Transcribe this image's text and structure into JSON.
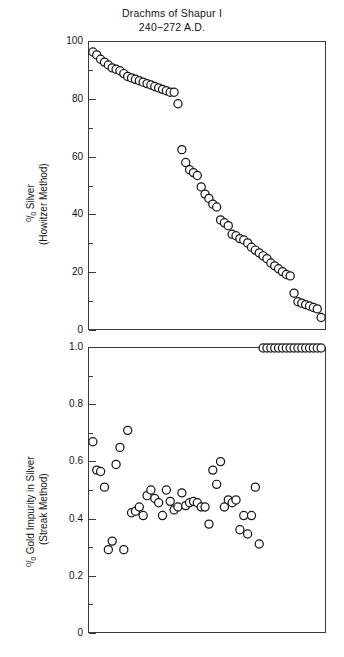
{
  "figure": {
    "title_line1": "Drachms of Shapur I",
    "title_line2": "240−272 A.D."
  },
  "panels": {
    "top": {
      "axis_title_line1": "Silver",
      "axis_title_line2": "(Howitzer Method)",
      "percent_symbol": "%",
      "ytick_labels": [
        "100",
        "80",
        "60",
        "40",
        "20",
        "0"
      ]
    },
    "bottom": {
      "axis_title_line1": "Gold Impurity in Silver",
      "axis_title_line2": "(Streak Method)",
      "percent_symbol": "%",
      "ytick_labels": [
        "1.0",
        "0.8",
        "0.6",
        "0.4",
        "0.2",
        "0"
      ]
    }
  },
  "chart_data": [
    {
      "type": "scatter",
      "title": "Drachms of Shapur I 240−272 A.D.",
      "panel": "top",
      "xlabel": "",
      "ylabel": "% Silver (Howitzer Method)",
      "ylim": [
        0,
        100
      ],
      "xlim": [
        0,
        61
      ],
      "yticks": [
        0,
        20,
        40,
        60,
        80,
        100
      ],
      "yminorticks": [
        10,
        30,
        50,
        70,
        90
      ],
      "xticks": [],
      "grid": false,
      "legend": false,
      "marker": "open-circle",
      "series": [
        {
          "name": "% Silver (Howitzer Method)",
          "x": [
            1,
            2,
            3,
            4,
            5,
            6,
            7,
            8,
            9,
            10,
            11,
            12,
            13,
            14,
            15,
            16,
            17,
            18,
            19,
            20,
            21,
            22,
            23,
            24,
            25,
            26,
            27,
            28,
            29,
            30,
            31,
            32,
            33,
            34,
            35,
            36,
            37,
            38,
            39,
            40,
            41,
            42,
            43,
            44,
            45,
            46,
            47,
            48,
            49,
            50,
            51,
            52,
            53,
            54,
            55,
            56,
            57,
            58,
            59,
            60
          ],
          "y": [
            96.5,
            95.5,
            94.0,
            93.0,
            92.0,
            91.0,
            90.5,
            90.0,
            89.0,
            88.0,
            87.5,
            87.0,
            86.5,
            86.0,
            85.5,
            85.0,
            84.5,
            84.0,
            83.5,
            83.0,
            82.5,
            82.5,
            78.5,
            62.5,
            58.0,
            55.5,
            54.5,
            53.5,
            49.5,
            47.0,
            45.5,
            43.5,
            42.5,
            38.0,
            37.0,
            36.0,
            33.0,
            32.5,
            31.5,
            31.0,
            30.0,
            28.5,
            27.5,
            26.5,
            25.5,
            24.5,
            23.0,
            22.0,
            21.0,
            20.0,
            19.0,
            18.5,
            12.5,
            9.5,
            9.0,
            8.5,
            8.0,
            7.5,
            7.0,
            4.0
          ]
        }
      ]
    },
    {
      "type": "scatter",
      "panel": "bottom",
      "xlabel": "",
      "ylabel": "% Gold Impurity in Silver (Streak Method)",
      "ylim": [
        0,
        1.0
      ],
      "xlim": [
        0,
        61
      ],
      "yticks": [
        0,
        0.2,
        0.4,
        0.6,
        0.8,
        1.0
      ],
      "yminorticks": [
        0.1,
        0.3,
        0.5,
        0.7,
        0.9
      ],
      "xticks": [],
      "grid": false,
      "legend": false,
      "marker": "open-circle",
      "series": [
        {
          "name": "% Gold Impurity in Silver (Streak Method)",
          "x": [
            1,
            2,
            3,
            4,
            5,
            6,
            7,
            8,
            9,
            10,
            11,
            12,
            13,
            14,
            15,
            16,
            17,
            18,
            19,
            20,
            21,
            22,
            23,
            24,
            25,
            26,
            27,
            28,
            29,
            30,
            31,
            32,
            33,
            34,
            35,
            36,
            37,
            38,
            39,
            40,
            41,
            42,
            43,
            44,
            45,
            46,
            47,
            48,
            49,
            50,
            51,
            52,
            53,
            54,
            55,
            56,
            57,
            58,
            59,
            60
          ],
          "y": [
            0.67,
            0.57,
            0.565,
            0.51,
            0.29,
            0.32,
            0.59,
            0.65,
            0.29,
            0.71,
            0.42,
            0.425,
            0.44,
            0.41,
            0.48,
            0.5,
            0.47,
            0.455,
            0.41,
            0.5,
            0.46,
            0.43,
            0.44,
            0.49,
            0.445,
            0.455,
            0.46,
            0.455,
            0.44,
            0.44,
            0.38,
            0.57,
            0.52,
            0.6,
            0.44,
            0.465,
            0.455,
            0.465,
            0.36,
            0.41,
            0.345,
            0.41,
            0.51,
            0.31
          ]
        }
      ]
    }
  ]
}
